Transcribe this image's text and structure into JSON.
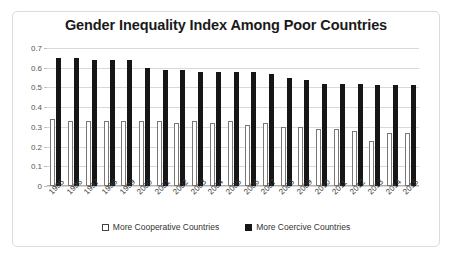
{
  "card": {
    "title": "Gender Inequality Index Among Poor Countries"
  },
  "legend": {
    "items": [
      {
        "label": "More Cooperative Countries",
        "marker": "hollow-square-icon",
        "color": "#ffffff"
      },
      {
        "label": "More Coercive Countries",
        "marker": "filled-square-icon",
        "color": "#161616"
      }
    ]
  },
  "axis": {
    "y_ticks": [
      "0.7",
      "0.6",
      "0.5",
      "0.4",
      "0.3",
      "0.2",
      "0.1",
      "0"
    ]
  },
  "chart_data": {
    "type": "bar",
    "title": "Gender Inequality Index Among Poor Countries",
    "xlabel": "",
    "ylabel": "",
    "ylim": [
      0,
      0.7
    ],
    "ytick_step": 0.1,
    "grid": true,
    "legend_position": "bottom",
    "categories": [
      "1995",
      "1996",
      "1997",
      "1998",
      "1999",
      "2000",
      "2001",
      "2002",
      "2003",
      "2004",
      "2005",
      "2006",
      "2007",
      "2008",
      "2009",
      "2010",
      "2011",
      "2012",
      "2013",
      "2014",
      "2015"
    ],
    "series": [
      {
        "name": "More Cooperative Countries",
        "color": "#ffffff",
        "values": [
          0.34,
          0.33,
          0.33,
          0.33,
          0.33,
          0.33,
          0.33,
          0.32,
          0.33,
          0.32,
          0.33,
          0.31,
          0.32,
          0.3,
          0.3,
          0.29,
          0.29,
          0.28,
          0.23,
          0.27,
          0.27
        ]
      },
      {
        "name": "More Coercive Countries",
        "color": "#161616",
        "values": [
          0.65,
          0.65,
          0.64,
          0.64,
          0.64,
          0.6,
          0.59,
          0.59,
          0.58,
          0.58,
          0.58,
          0.58,
          0.57,
          0.55,
          0.54,
          0.52,
          0.52,
          0.52,
          0.51,
          0.51,
          0.51
        ]
      }
    ]
  }
}
